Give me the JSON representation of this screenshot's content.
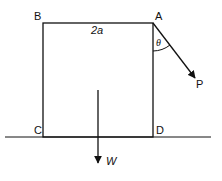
{
  "labels": {
    "A": "A",
    "B": "B",
    "C": "C",
    "D": "D",
    "side": "2a",
    "angle": "θ",
    "force_p": "P",
    "weight": "W"
  },
  "colors": {
    "stroke": "#111111",
    "background": "#ffffff"
  }
}
